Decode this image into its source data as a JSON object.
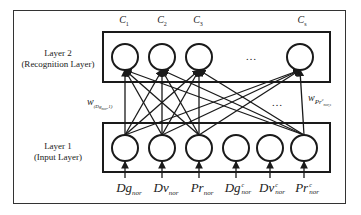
{
  "layers": {
    "layer2": {
      "title": "Layer 2",
      "subtitle": "(Recognition Layer)"
    },
    "layer1": {
      "title": "Layer 1",
      "subtitle": "(Input Layer)"
    }
  },
  "output_nodes": [
    {
      "base": "C",
      "sub": "1"
    },
    {
      "base": "C",
      "sub": "2"
    },
    {
      "base": "C",
      "sub": "3"
    },
    {
      "base": "C",
      "sub": "s"
    }
  ],
  "input_nodes": [
    {
      "base": "Dg",
      "sup": "",
      "sub": "nor"
    },
    {
      "base": "Dv",
      "sup": "",
      "sub": "nor"
    },
    {
      "base": "Pr",
      "sup": "",
      "sub": "nor"
    },
    {
      "base": "Dg",
      "sup": "c",
      "sub": "nor"
    },
    {
      "base": "Dv",
      "sup": "c",
      "sub": "nor"
    },
    {
      "base": "Pr",
      "sup": "c",
      "sub": "nor"
    }
  ],
  "weights": {
    "left": {
      "base": "w",
      "sub": "(Dg_nor,1)"
    },
    "right": {
      "base": "w",
      "sub": "Pr^c_nor,s"
    }
  },
  "ellipsis": {
    "output_gap": "…",
    "connection_gap": "…"
  },
  "connections": {
    "connected_inputs": [
      "Dg_nor",
      "Dv_nor",
      "Pr_nor",
      "Pr^c_nor"
    ],
    "unconnected_inputs": [
      "Dg^c_nor",
      "Dv^c_nor"
    ],
    "pattern": "each connected input links to every output node (C1, C2, C3, Cs)"
  }
}
